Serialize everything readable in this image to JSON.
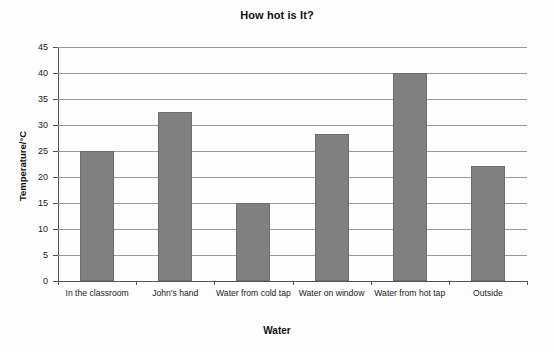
{
  "chart_data": {
    "type": "bar",
    "title": "How hot is It?",
    "xlabel": "Water",
    "ylabel": "Temperature/°C",
    "categories": [
      "In the classroom",
      "John's hand",
      "Water from cold tap",
      "Water on window",
      "Water from hot tap",
      "Outside"
    ],
    "values": [
      25,
      32.5,
      15,
      28.3,
      40,
      22.2
    ],
    "ylim": [
      0,
      45
    ],
    "ytick_labels": [
      "45",
      "40",
      "35",
      "30",
      "25",
      "20",
      "15",
      "10",
      "5",
      "0"
    ],
    "ytick_values": [
      45,
      40,
      35,
      30,
      25,
      20,
      15,
      10,
      5,
      0
    ],
    "ytick_step": 5,
    "grid": true,
    "legend": false,
    "bar_color": "#808080",
    "grid_color": "#9a9a9a",
    "axis_color": "#555555",
    "background": "#ffffff"
  }
}
